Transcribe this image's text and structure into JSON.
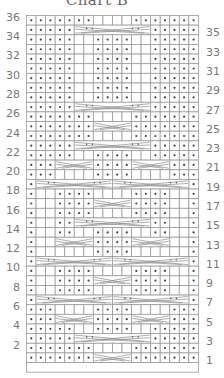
{
  "title": "Chart B",
  "grid": {
    "columns": 18,
    "rows_total": 36,
    "cell_w": 9.55,
    "cell_h": 9.64,
    "line_color": "#9a9a9a",
    "dot_color": "#444444",
    "cable_color": "#8a8a8a"
  },
  "legend_encoding": {
    ".": "purl (dot)",
    "_": "knit (blank)",
    "C": "cable segment"
  },
  "rows": [
    {
      "n": 36,
      "side": "left",
      "pattern": ".......____.......",
      "cables": []
    },
    {
      "n": 35,
      "side": "right",
      "pattern": ".....CCCCCCCC.....",
      "cables": [
        {
          "start": 6,
          "span": 8
        }
      ]
    },
    {
      "n": 34,
      "side": "left",
      "pattern": ".....__....__.....",
      "cables": []
    },
    {
      "n": 33,
      "side": "right",
      "pattern": ".....__....__.....",
      "cables": []
    },
    {
      "n": 32,
      "side": "left",
      "pattern": ".....__....__.....",
      "cables": []
    },
    {
      "n": 31,
      "side": "right",
      "pattern": ".....__....__.....",
      "cables": []
    },
    {
      "n": 30,
      "side": "left",
      "pattern": ".....__....__.....",
      "cables": []
    },
    {
      "n": 29,
      "side": "right",
      "pattern": ".....__....__.....",
      "cables": []
    },
    {
      "n": 28,
      "side": "left",
      "pattern": ".....__....__.....",
      "cables": []
    },
    {
      "n": 27,
      "side": "right",
      "pattern": ".....CCCCCCCC.....",
      "cables": [
        {
          "start": 6,
          "span": 8
        }
      ]
    },
    {
      "n": 26,
      "side": "left",
      "pattern": ".......____.......",
      "cables": []
    },
    {
      "n": 25,
      "side": "right",
      "pattern": ".......CCCC.......",
      "cables": [
        {
          "start": 8,
          "span": 4
        }
      ]
    },
    {
      "n": 24,
      "side": "left",
      "pattern": ".......____.......",
      "cables": []
    },
    {
      "n": 23,
      "side": "right",
      "pattern": ".....CCCCCCCC.....",
      "cables": [
        {
          "start": 6,
          "span": 8
        }
      ]
    },
    {
      "n": 22,
      "side": "left",
      "pattern": ".....__....__.....",
      "cables": []
    },
    {
      "n": 21,
      "side": "right",
      "pattern": "...CCCC....CCCC...",
      "cables": [
        {
          "start": 4,
          "span": 4
        },
        {
          "start": 12,
          "span": 4
        }
      ]
    },
    {
      "n": 20,
      "side": "left",
      "pattern": "...____....____...",
      "cables": []
    },
    {
      "n": 19,
      "side": "right",
      "pattern": ".CCCCCCCCCCCCCCCC.",
      "cables": [
        {
          "start": 2,
          "span": 8
        },
        {
          "start": 10,
          "span": 8
        }
      ]
    },
    {
      "n": 18,
      "side": "left",
      "pattern": ".__....____....__.",
      "cables": []
    },
    {
      "n": 17,
      "side": "right",
      "pattern": ".__....CCCC....__.",
      "cables": [
        {
          "start": 8,
          "span": 4
        }
      ]
    },
    {
      "n": 16,
      "side": "left",
      "pattern": ".__....____....__.",
      "cables": []
    },
    {
      "n": 15,
      "side": "right",
      "pattern": ".__..CCCCCCCC..__.",
      "cables": [
        {
          "start": 6,
          "span": 8
        }
      ]
    },
    {
      "n": 14,
      "side": "left",
      "pattern": ".__..__....__..__.",
      "cables": []
    },
    {
      "n": 13,
      "side": "right",
      "pattern": ".__CCCC....CCCC__.",
      "cables": [
        {
          "start": 4,
          "span": 4
        },
        {
          "start": 12,
          "span": 4
        }
      ]
    },
    {
      "n": 12,
      "side": "left",
      "pattern": ".______....______.",
      "cables": []
    },
    {
      "n": 11,
      "side": "right",
      "pattern": ".CCCCCCCCCCCCCCCC.",
      "cables": [
        {
          "start": 2,
          "span": 8
        },
        {
          "start": 10,
          "span": 8
        }
      ]
    },
    {
      "n": 10,
      "side": "left",
      "pattern": ".__....____....__.",
      "cables": []
    },
    {
      "n": 9,
      "side": "right",
      "pattern": ".__....CCCC....__.",
      "cables": [
        {
          "start": 8,
          "span": 4
        }
      ]
    },
    {
      "n": 8,
      "side": "left",
      "pattern": ".__....____....__.",
      "cables": []
    },
    {
      "n": 7,
      "side": "right",
      "pattern": ".CCCCCCCCCCCCCCCC.",
      "cables": [
        {
          "start": 2,
          "span": 8
        },
        {
          "start": 10,
          "span": 8
        }
      ]
    },
    {
      "n": 6,
      "side": "left",
      "pattern": "...____....____...",
      "cables": []
    },
    {
      "n": 5,
      "side": "right",
      "pattern": "...CCCC....CCCC...",
      "cables": [
        {
          "start": 4,
          "span": 4
        },
        {
          "start": 12,
          "span": 4
        }
      ]
    },
    {
      "n": 4,
      "side": "left",
      "pattern": ".....__....__.....",
      "cables": []
    },
    {
      "n": 3,
      "side": "right",
      "pattern": ".....CCCCCCCC.....",
      "cables": [
        {
          "start": 6,
          "span": 8
        }
      ]
    },
    {
      "n": 2,
      "side": "left",
      "pattern": ".......____.......",
      "cables": []
    },
    {
      "n": 1,
      "side": "right",
      "pattern": ".......CCCC.......",
      "cables": [
        {
          "start": 8,
          "span": 4
        }
      ]
    },
    {
      "n": null,
      "side": "none",
      "pattern": "",
      "cables": [],
      "blank_footer": true
    }
  ],
  "left_labels": [
    "36",
    "34",
    "32",
    "30",
    "28",
    "26",
    "24",
    "22",
    "20",
    "18",
    "16",
    "14",
    "12",
    "10",
    "8",
    "6",
    "4",
    "2"
  ],
  "right_labels": [
    "35",
    "33",
    "31",
    "29",
    "27",
    "25",
    "23",
    "21",
    "19",
    "17",
    "15",
    "13",
    "11",
    "9",
    "7",
    "5",
    "3",
    "1"
  ]
}
